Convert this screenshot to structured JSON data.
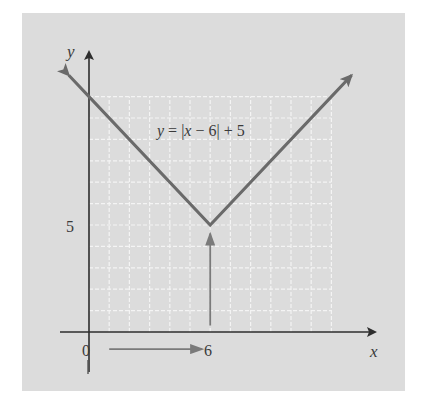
{
  "chart_data": {
    "type": "line",
    "title": "",
    "equation_label": "y = |x − 6| + 5",
    "equation_parts": {
      "lhs": "y",
      "eq": " = |",
      "var": "x",
      "rest": " − 6| + 5"
    },
    "xlabel": "x",
    "ylabel": "y",
    "x_tick_labels": [
      {
        "value": 0,
        "label": "0"
      },
      {
        "value": 6,
        "label": "6"
      }
    ],
    "y_tick_labels": [
      {
        "value": 5,
        "label": "5"
      }
    ],
    "xlim": [
      -1.5,
      13
    ],
    "ylim": [
      -1.5,
      12
    ],
    "grid": true,
    "grid_extent": {
      "x": [
        0,
        12
      ],
      "y": [
        0,
        11
      ]
    },
    "series": [
      {
        "name": "y = |x − 6| + 5",
        "x": [
          -1,
          0,
          6,
          12,
          13
        ],
        "y": [
          12,
          11,
          5,
          11,
          12
        ],
        "vertex": {
          "x": 6,
          "y": 5
        }
      }
    ],
    "annotations": [
      {
        "type": "arrow",
        "from": [
          1,
          -0.8
        ],
        "to": [
          5.6,
          -0.8
        ],
        "meaning": "horizontal shift right 6"
      },
      {
        "type": "arrow",
        "from": [
          6,
          0.3
        ],
        "to": [
          6,
          4.6
        ],
        "meaning": "vertical shift up 5"
      }
    ]
  },
  "colors": {
    "background": "#dcdcdc",
    "grid": "#f4f4f4",
    "graph_line": "#6a6a6a",
    "axis": "#2e2e2e",
    "annotation_arrow": "#7a7a7a",
    "text": "#3a3a3a"
  }
}
